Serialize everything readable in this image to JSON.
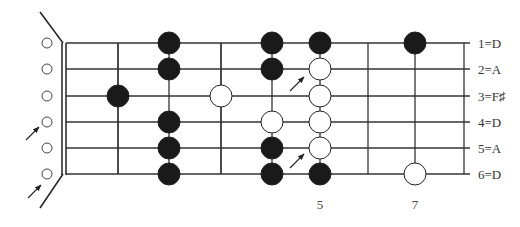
{
  "diagram": {
    "type": "guitar-fretboard",
    "tuning_labels": [
      "1=D",
      "2=A",
      "3=F♯",
      "4=D",
      "5=A",
      "6=D"
    ],
    "fret_markers": [
      {
        "label": "5",
        "x": 320
      },
      {
        "label": "7",
        "x": 415
      }
    ],
    "string_y": [
      43,
      69,
      96,
      122,
      148,
      174
    ],
    "fret_lines_x": [
      118,
      221,
      368,
      464
    ],
    "connector_lines": [
      {
        "x": 118,
        "y1": 43,
        "y2": 174
      },
      {
        "x": 169,
        "y1": 43,
        "y2": 174
      },
      {
        "x": 221,
        "y1": 43,
        "y2": 174
      },
      {
        "x": 272,
        "y1": 43,
        "y2": 174
      },
      {
        "x": 320,
        "y1": 43,
        "y2": 174
      },
      {
        "x": 415,
        "y1": 43,
        "y2": 174
      }
    ],
    "notes": [
      {
        "x": 118,
        "string": 3,
        "fill": "black"
      },
      {
        "x": 169,
        "string": 1,
        "fill": "black"
      },
      {
        "x": 169,
        "string": 2,
        "fill": "black"
      },
      {
        "x": 169,
        "string": 4,
        "fill": "black"
      },
      {
        "x": 169,
        "string": 5,
        "fill": "black"
      },
      {
        "x": 169,
        "string": 6,
        "fill": "black"
      },
      {
        "x": 221,
        "string": 3,
        "fill": "white"
      },
      {
        "x": 272,
        "string": 1,
        "fill": "black"
      },
      {
        "x": 272,
        "string": 2,
        "fill": "black"
      },
      {
        "x": 272,
        "string": 4,
        "fill": "white"
      },
      {
        "x": 272,
        "string": 5,
        "fill": "black"
      },
      {
        "x": 272,
        "string": 6,
        "fill": "black"
      },
      {
        "x": 320,
        "string": 1,
        "fill": "black"
      },
      {
        "x": 320,
        "string": 2,
        "fill": "white"
      },
      {
        "x": 320,
        "string": 3,
        "fill": "white"
      },
      {
        "x": 320,
        "string": 4,
        "fill": "white"
      },
      {
        "x": 320,
        "string": 5,
        "fill": "white"
      },
      {
        "x": 320,
        "string": 6,
        "fill": "black"
      },
      {
        "x": 415,
        "string": 1,
        "fill": "black"
      },
      {
        "x": 415,
        "string": 6,
        "fill": "white"
      }
    ],
    "open_strings": [
      1,
      2,
      3,
      4,
      5,
      6
    ],
    "arrows": [
      {
        "x1": 26,
        "y1": 140,
        "x2": 39,
        "y2": 127
      },
      {
        "x1": 28,
        "y1": 198,
        "x2": 41,
        "y2": 185
      },
      {
        "x1": 290,
        "y1": 91,
        "x2": 304,
        "y2": 77
      },
      {
        "x1": 290,
        "y1": 168,
        "x2": 304,
        "y2": 154
      }
    ],
    "colors": {
      "ink": "#222222",
      "line": "#444444",
      "background": "#ffffff"
    }
  }
}
